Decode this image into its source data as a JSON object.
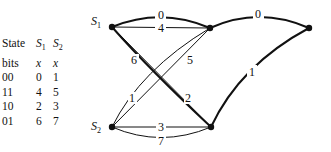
{
  "table": {
    "headers": [
      {
        "col0": "State",
        "col1": "S",
        "col1_sub": "1",
        "col2": "S",
        "col2_sub": "2"
      },
      {
        "col0": "bits",
        "col1": "x",
        "col2": "x"
      }
    ],
    "rows": [
      {
        "bits": "00",
        "s1": "0",
        "s2": "1"
      },
      {
        "bits": "11",
        "s1": "4",
        "s2": "5"
      },
      {
        "bits": "10",
        "s1": "2",
        "s2": "3"
      },
      {
        "bits": "01",
        "s1": "6",
        "s2": "7"
      }
    ]
  },
  "diagram": {
    "nodes": [
      {
        "id": "S1",
        "label": "S",
        "sub": "1"
      },
      {
        "id": "S2",
        "label": "S",
        "sub": "2"
      }
    ],
    "edge_labels": {
      "s1_top_curve": "0",
      "s1_top_straight": "4",
      "s1_bottom_diag": "6",
      "s1_bottom_thick": "2",
      "s2_top_diag": "1",
      "s2_top_cross": "5",
      "s2_bottom_straight": "3",
      "s2_bottom_curve": "7",
      "top_right_curve": "0",
      "bottom_right_curve": "1"
    }
  }
}
